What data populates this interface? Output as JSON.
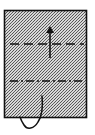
{
  "diagram": {
    "type": "folding-instruction",
    "paper": {
      "shape": "rectangle",
      "fill": "stippled-gray",
      "stroke": "#111111",
      "x": 4,
      "y": 10,
      "width": 83,
      "height": 108
    },
    "fold_lines": [
      {
        "kind": "valley-fold",
        "style": "dashed",
        "y": 44
      },
      {
        "kind": "mountain-fold",
        "style": "dash-dot",
        "y": 81
      }
    ],
    "arrows": [
      {
        "kind": "fold-up-arrow",
        "direction": "up",
        "x": 50,
        "from_y": 58,
        "to_y": 28
      },
      {
        "kind": "tuck-loop-arrow",
        "direction": "tuck-under"
      }
    ],
    "colors": {
      "ink": "#111111",
      "stipple_dark": "#555555",
      "stipple_light": "#d8d8d8",
      "background": "#ffffff"
    }
  }
}
